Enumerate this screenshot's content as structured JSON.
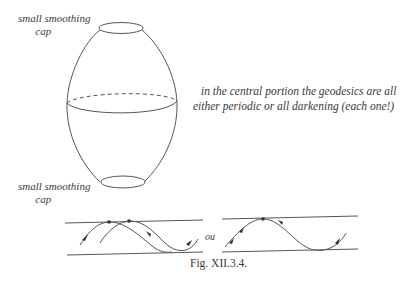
{
  "figure": {
    "caption": "Fig. XII.3.4.",
    "labels": {
      "top_cap_line1": "small smoothing",
      "top_cap_line2": "cap",
      "bottom_cap_line1": "small smoothing",
      "bottom_cap_line2": "cap",
      "central_note_line1": "in the central portion the geodesics are all",
      "central_note_line2": "either periodic or all darkening (each one!)",
      "connector": "ou"
    },
    "elements": {
      "surface": "egg-shaped surface of revolution",
      "top_cap": "ellipse at top",
      "equator": "ellipse with dashed back half",
      "bottom_cap": "ellipse at bottom",
      "left_strip": "band with two crossing sinusoidal geodesics, two marked points, arrows",
      "right_strip": "band with one sinusoidal geodesic, one marked point, arrows"
    },
    "colors": {
      "stroke": "#555555",
      "text": "#3a3a3a",
      "background": "#ffffff"
    }
  }
}
